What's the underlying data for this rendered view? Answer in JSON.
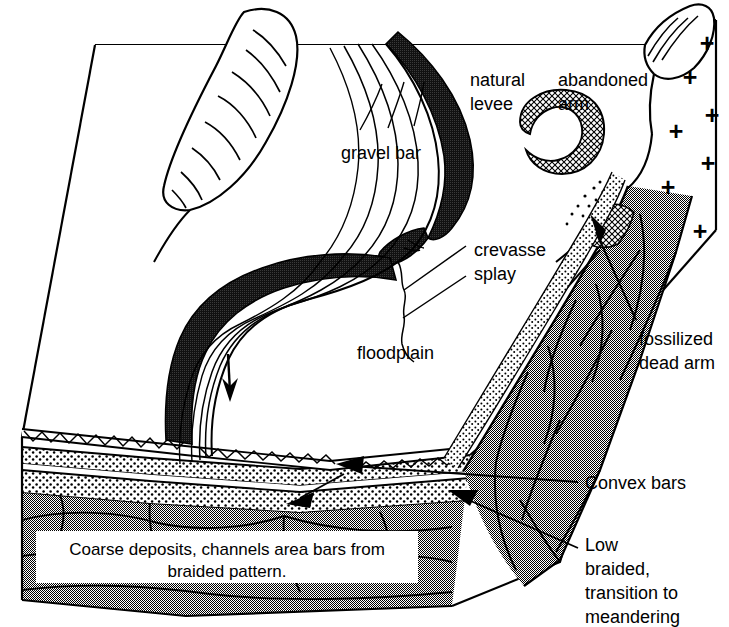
{
  "figure": {
    "kind": "block-diagram",
    "background_color": "#ffffff",
    "ink_color": "#000000"
  },
  "palette": {
    "ink": "#000000",
    "levee_dark": "#1a1a1a",
    "terrace_gray": "#9d9d9d",
    "gray_light": "#c9c9c9",
    "sand_stipple": "#ffffff",
    "caption_box": "#ffffff",
    "white": "#ffffff"
  },
  "labels": {
    "natural_levee": {
      "line1": "natural",
      "line2": "levee",
      "x": 470,
      "y": 86
    },
    "abandoned_arm": {
      "line1": "abandoned",
      "line2": "arm",
      "x": 558,
      "y": 86
    },
    "gravel_bar": {
      "text": "gravel bar",
      "x": 341,
      "y": 159
    },
    "crevasse_splay": {
      "line1": "crevasse",
      "line2": "splay",
      "x": 474,
      "y": 256
    },
    "floodplain": {
      "text": "floodplain",
      "x": 357,
      "y": 359
    },
    "fossilized_dead_arm": {
      "line1": "fossilized",
      "line2": "dead arm",
      "x": 639,
      "y": 345
    },
    "convex_bars": {
      "text": "Convex  bars",
      "x": 585,
      "y": 489
    },
    "low_braided": {
      "line1": "Low",
      "line2": "braided,",
      "line3": "transition to",
      "line4": "meandering",
      "x": 585,
      "y": 551
    }
  },
  "caption_box": {
    "line1": "Coarse deposits, channels area bars from",
    "line2": "braided pattern.",
    "x": 36,
    "y": 531,
    "width": 382,
    "height": 52
  },
  "bedrock_symbols": {
    "glyph": "+",
    "name": "crystalline-bedrock-plus-symbol",
    "count": 8,
    "positions": [
      {
        "x": 707,
        "y": 52
      },
      {
        "x": 690,
        "y": 86
      },
      {
        "x": 712,
        "y": 124
      },
      {
        "x": 676,
        "y": 140
      },
      {
        "x": 708,
        "y": 172
      },
      {
        "x": 668,
        "y": 196
      },
      {
        "x": 700,
        "y": 240
      },
      {
        "x": 666,
        "y": 243
      }
    ]
  },
  "flow_arrow": {
    "name": "flow-direction-arrow",
    "description": "downstream flow direction on floodplain",
    "x": 230,
    "y": 365
  },
  "stratigraphy": {
    "units": [
      {
        "name": "zigzag-coarse-lag",
        "pattern": "zigzag"
      },
      {
        "name": "upper-sand-stipple",
        "pattern": "stipple"
      },
      {
        "name": "lower-sand-stipple",
        "pattern": "stipple"
      },
      {
        "name": "cross-bedded-gravel",
        "pattern": "gray-crossbed"
      }
    ]
  },
  "features": [
    {
      "name": "hill-hachured",
      "description": "elongate hachured hill upper left"
    },
    {
      "name": "oxbow-lake-abandoned-arm",
      "description": "crescent crosshatched abandoned channel"
    },
    {
      "name": "natural-levee-dark-band",
      "description": "dark levee ribbon along channel"
    },
    {
      "name": "point-bar-scroll-lines",
      "description": "curved scroll bars in meander loop"
    },
    {
      "name": "valley-wall-terrace",
      "description": "gray cross-bedded terrace on right"
    },
    {
      "name": "fossil-channel-crosshatch",
      "description": "crosshatched fossil channel in terrace"
    }
  ]
}
